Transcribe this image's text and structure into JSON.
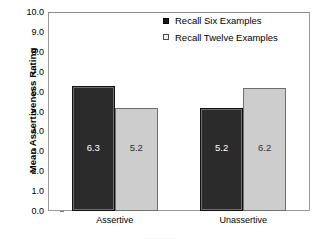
{
  "chart_data": {
    "type": "bar",
    "title": "",
    "xlabel": "",
    "ylabel": "Mean Assertiveness Rating",
    "categories": [
      "Assertive",
      "Unassertive"
    ],
    "series": [
      {
        "name": "Recall Six Examples",
        "values": [
          6.3,
          5.2
        ],
        "color": "#2b2b2b"
      },
      {
        "name": "Recall Twelve Examples",
        "values": [
          5.2,
          6.2
        ],
        "color": "#cdcdcd"
      }
    ],
    "ylim": [
      0.0,
      10.0
    ],
    "ytick_labels": [
      "10.0",
      "9.0",
      "8.0",
      "7.0",
      "6.0",
      "5.0",
      "4.0",
      "3.0",
      "2.0",
      "1.0",
      "0.0"
    ],
    "ytick_values": [
      10.0,
      9.0,
      8.0,
      7.0,
      6.0,
      5.0,
      4.0,
      3.0,
      2.0,
      1.0,
      0.0
    ],
    "grid": false,
    "legend_position": "top-right",
    "data_labels": [
      "6.3",
      "5.2",
      "5.2",
      "6.2"
    ]
  },
  "legend": {
    "items": [
      {
        "label": "Recall Six Examples",
        "style": "dark"
      },
      {
        "label": "Recall Twelve Examples",
        "style": "light"
      }
    ]
  },
  "caption_fragment": "................."
}
